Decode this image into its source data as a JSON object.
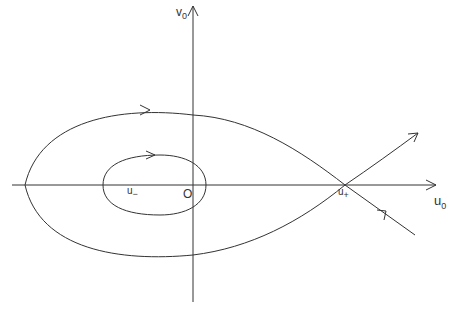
{
  "figure": {
    "type": "phase portrait",
    "axes": {
      "x_label": "u",
      "x_label_sub": "0",
      "y_label": "v",
      "y_label_sub": "0"
    },
    "points": {
      "origin": "O",
      "u_minus": "u",
      "u_minus_sub": "−",
      "u_plus": "u",
      "u_plus_sub": "+"
    },
    "curves": [
      {
        "name": "homoclinic-orbit",
        "description": "outer loop through saddle u+",
        "direction": "clockwise"
      },
      {
        "name": "periodic-orbit",
        "description": "inner closed orbit around u−",
        "direction": "clockwise"
      },
      {
        "name": "unstable-manifold",
        "description": "leaves u+ to upper right"
      },
      {
        "name": "stable-manifold",
        "description": "enters u+ from lower right"
      }
    ],
    "colors": {
      "stroke": "#333333",
      "background": "#ffffff"
    }
  }
}
